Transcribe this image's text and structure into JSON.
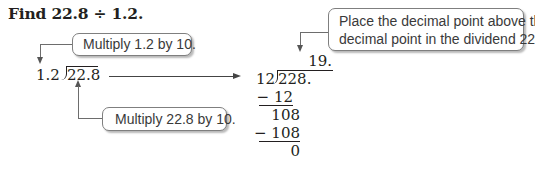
{
  "title": "Find 22.8 ÷ 1.2.",
  "callouts": {
    "multiply_divisor": "Multiply 1.2 by 10.",
    "multiply_dividend": "Multiply 22.8 by 10.",
    "place_decimal_line1": "Place the decimal point above the",
    "place_decimal_line2": "decimal point in the dividend 228."
  },
  "original_problem": {
    "divisor": "1.2",
    "dividend": "22.8"
  },
  "long_division": {
    "quotient": "19.",
    "divisor": "12",
    "dividend": "228.",
    "steps": [
      {
        "text": "− 12",
        "underline": true
      },
      {
        "text": "108",
        "underline": false
      },
      {
        "text": "− 108",
        "underline": true
      },
      {
        "text": "0",
        "underline": false
      }
    ]
  }
}
